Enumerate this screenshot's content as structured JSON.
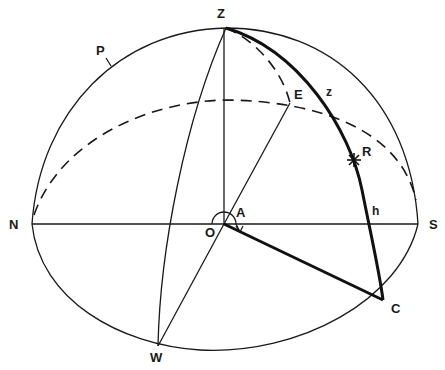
{
  "diagram": {
    "type": "celestial-sphere-horizon-coordinates",
    "labels": {
      "zenith": "Z",
      "pole": "P",
      "east": "E",
      "zenith_distance": "z",
      "star": "R",
      "north": "N",
      "south": "S",
      "observer": "O",
      "azimuth": "A",
      "altitude": "h",
      "foot_point": "C",
      "west": "W"
    },
    "colors": {
      "line": "#1a1a1a",
      "background": "#ffffff"
    }
  }
}
